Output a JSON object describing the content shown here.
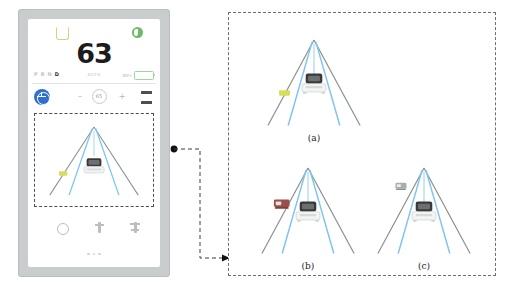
{
  "figure": {
    "type": "adas-hmi-illustration",
    "colors": {
      "bezel": "#c9cdcd",
      "screen": "#ffffff",
      "accent_blue": "#2f6fd0",
      "lane_blue": "#7ec4ef",
      "lane_edge": "#8a8f8f",
      "battery_green": "#5fb85a",
      "seatbelt_amber": "#d9d27a",
      "eco_green": "#6fba6a",
      "hazard_yellow": "#d8dd5a",
      "vehicle_red": "#9c4f4a",
      "vehicle_gray": "#a9adad",
      "dash_border": "#4a4f4f"
    }
  },
  "tablet": {
    "top_icons": [
      {
        "name": "seatbelt-warning-icon",
        "color": "#d9d27a"
      },
      {
        "name": "eco-mode-icon",
        "color": "#6fba6a"
      }
    ],
    "speed": {
      "value": "63",
      "unit_label": "km/h"
    },
    "status_bar": {
      "gears": [
        {
          "letter": "P",
          "active": false
        },
        {
          "letter": "R",
          "active": false
        },
        {
          "letter": "N",
          "active": false
        },
        {
          "letter": "D",
          "active": true
        }
      ],
      "center_label": "AUTO",
      "battery_label": "88%",
      "battery_percent": 82
    },
    "controls": {
      "steering_button": "steering-wheel-icon",
      "decrease_label": "–",
      "increase_label": "+",
      "cruise_value": "65",
      "cruise_caption": "SET",
      "menu_button": "menu-icon"
    },
    "road_view": {
      "highlighted": true,
      "ego_vehicle": "white-car-rear",
      "left_hazard": "yellow-marker",
      "lane_count": 2
    },
    "bottom_icons": [
      {
        "name": "ac-dial-icon"
      },
      {
        "name": "fan-icon"
      },
      {
        "name": "seat-heater-icon"
      }
    ],
    "home_dots": 3
  },
  "panel": {
    "subfigures": [
      {
        "id": "a",
        "label": "(a)",
        "ego_vehicle": "white-car-rear",
        "object": {
          "kind": "yellow-marker",
          "color": "#d8dd5a",
          "side": "left",
          "depth": "near"
        }
      },
      {
        "id": "b",
        "label": "(b)",
        "ego_vehicle": "white-car-rear",
        "object": {
          "kind": "red-vehicle",
          "color": "#9c4f4a",
          "side": "left",
          "depth": "mid"
        }
      },
      {
        "id": "c",
        "label": "(c)",
        "ego_vehicle": "white-car-rear",
        "object": {
          "kind": "gray-vehicle",
          "color": "#a9adad",
          "side": "left",
          "depth": "far"
        }
      }
    ]
  },
  "connector": {
    "name": "callout-arrow",
    "from": "tablet-road-view",
    "to": "figure-panel",
    "style": "dashed"
  }
}
